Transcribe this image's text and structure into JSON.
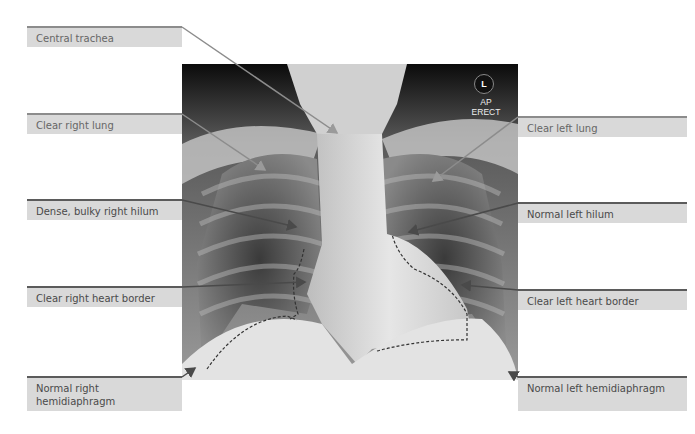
{
  "figure": {
    "image_subject": "Chest X-ray (frontal view)",
    "orientation_marker": "L",
    "projection": [
      "AP",
      "ERECT"
    ]
  },
  "labels": {
    "left": [
      {
        "id": "central-trachea",
        "text": "Central trachea"
      },
      {
        "id": "clear-right-lung",
        "text": "Clear right lung"
      },
      {
        "id": "right-hilum",
        "text": "Dense, bulky right hilum"
      },
      {
        "id": "right-heart-border",
        "text": "Clear right heart border"
      },
      {
        "id": "right-hemidiaphragm",
        "text": "Normal right hemidiaphragm"
      }
    ],
    "right": [
      {
        "id": "clear-left-lung",
        "text": "Clear left lung"
      },
      {
        "id": "left-hilum",
        "text": "Normal left hilum"
      },
      {
        "id": "left-heart-border",
        "text": "Clear left heart border"
      },
      {
        "id": "left-hemidiaphragm",
        "text": "Normal left hemidiaphragm"
      }
    ]
  },
  "colors": {
    "label_fill": "#d9d9d9",
    "leader_dark": "#4a4a4a",
    "leader_light": "#8c8c8c",
    "text": "#4a4a4a"
  }
}
